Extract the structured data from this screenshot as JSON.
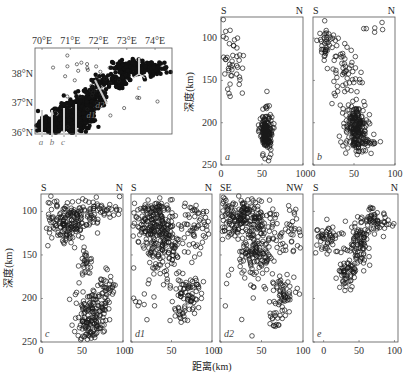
{
  "figure": {
    "y_axis_label": "深度(km)",
    "x_axis_label": "距离(km)"
  },
  "chart_data": [
    {
      "type": "scatter",
      "id": "map",
      "title": "",
      "xlabel": "",
      "ylabel": "",
      "xlim": [
        69.75,
        74.6
      ],
      "ylim": [
        35.95,
        38.9
      ],
      "x_ticks": [
        70,
        71,
        72,
        73,
        74
      ],
      "x_tick_labels": [
        "70°E",
        "71°E",
        "72°E",
        "73°E",
        "74°E"
      ],
      "y_ticks": [
        36,
        37,
        38
      ],
      "y_tick_labels": [
        "36°N",
        "37°N",
        "38°N"
      ],
      "profile_labels": [
        "a",
        "b",
        "c",
        "d1",
        "d2",
        "e"
      ],
      "description": "Epicenter map of dense seismicity band from ~70°E,36.2°N to ~74.3°E,38.4°N with profile lines a,b,c,d1,d2,e",
      "clusters": [
        {
          "cx": 70.3,
          "cy": 36.25,
          "sx": 0.25,
          "sy": 0.12,
          "n": 160,
          "fill": 1
        },
        {
          "cx": 70.9,
          "cy": 36.45,
          "sx": 0.3,
          "sy": 0.25,
          "n": 260,
          "fill": 1
        },
        {
          "cx": 71.4,
          "cy": 36.7,
          "sx": 0.25,
          "sy": 0.3,
          "n": 220,
          "fill": 1
        },
        {
          "cx": 71.8,
          "cy": 37.2,
          "sx": 0.2,
          "sy": 0.2,
          "n": 120,
          "fill": 1
        },
        {
          "cx": 72.4,
          "cy": 37.75,
          "sx": 0.3,
          "sy": 0.12,
          "n": 80,
          "fill": 1
        },
        {
          "cx": 73.0,
          "cy": 38.2,
          "sx": 0.25,
          "sy": 0.15,
          "n": 110,
          "fill": 1
        },
        {
          "cx": 73.8,
          "cy": 38.2,
          "sx": 0.35,
          "sy": 0.12,
          "n": 100,
          "fill": 1
        },
        {
          "cx": 72.0,
          "cy": 37.6,
          "sx": 0.8,
          "sy": 0.5,
          "n": 40,
          "fill": 0
        }
      ]
    },
    {
      "type": "scatter",
      "id": "a",
      "panel_label": "a",
      "left_dir": "S",
      "right_dir": "N",
      "xlim": [
        0,
        100
      ],
      "ylim": [
        250,
        75
      ],
      "x_ticks": [
        0,
        50,
        100
      ],
      "y_ticks": [
        100,
        150,
        200,
        250
      ],
      "clusters": [
        {
          "cx": 13,
          "cy": 128,
          "sx": 8,
          "sy": 17,
          "n": 45
        },
        {
          "cx": 55,
          "cy": 210,
          "sx": 3.5,
          "sy": 12,
          "n": 180
        },
        {
          "cx": 26,
          "cy": 165,
          "sx": 0,
          "sy": 0,
          "n": 1
        },
        {
          "cx": 56,
          "cy": 163,
          "sx": 0,
          "sy": 0,
          "n": 1
        }
      ]
    },
    {
      "type": "scatter",
      "id": "b",
      "panel_label": "b",
      "left_dir": "S",
      "right_dir": "N",
      "xlim": [
        0,
        100
      ],
      "ylim": [
        250,
        75
      ],
      "x_ticks": [
        0,
        50,
        100
      ],
      "y_ticks": [
        100,
        150,
        200,
        250
      ],
      "clusters": [
        {
          "cx": 16,
          "cy": 105,
          "sx": 5,
          "sy": 12,
          "n": 40
        },
        {
          "cx": 38,
          "cy": 140,
          "sx": 10,
          "sy": 15,
          "n": 55
        },
        {
          "cx": 52,
          "cy": 205,
          "sx": 6,
          "sy": 14,
          "n": 200
        },
        {
          "cx": 62,
          "cy": 225,
          "sx": 9,
          "sy": 6,
          "n": 30
        },
        {
          "cx": 75,
          "cy": 85,
          "sx": 8,
          "sy": 5,
          "n": 6
        }
      ]
    },
    {
      "type": "scatter",
      "id": "c",
      "panel_label": "c",
      "left_dir": "S",
      "right_dir": "N",
      "xlim": [
        0,
        100
      ],
      "ylim": [
        250,
        80
      ],
      "x_ticks": [
        0,
        50,
        100
      ],
      "y_ticks": [
        100,
        150,
        200,
        250
      ],
      "clusters": [
        {
          "cx": 35,
          "cy": 112,
          "sx": 14,
          "sy": 14,
          "n": 180
        },
        {
          "cx": 75,
          "cy": 100,
          "sx": 12,
          "sy": 10,
          "n": 50
        },
        {
          "cx": 55,
          "cy": 160,
          "sx": 4,
          "sy": 7,
          "n": 25
        },
        {
          "cx": 60,
          "cy": 225,
          "sx": 9,
          "sy": 18,
          "n": 170
        },
        {
          "cx": 78,
          "cy": 192,
          "sx": 5,
          "sy": 12,
          "n": 45
        }
      ]
    },
    {
      "type": "scatter",
      "id": "d1",
      "panel_label": "d1",
      "left_dir": "S",
      "right_dir": "N",
      "xlim": [
        0,
        100
      ],
      "ylim": [
        250,
        80
      ],
      "x_ticks": [
        0,
        50,
        100
      ],
      "y_ticks": [
        100,
        150,
        200,
        250
      ],
      "clusters": [
        {
          "cx": 25,
          "cy": 110,
          "sx": 15,
          "sy": 14,
          "n": 200
        },
        {
          "cx": 42,
          "cy": 145,
          "sx": 10,
          "sy": 18,
          "n": 120
        },
        {
          "cx": 85,
          "cy": 120,
          "sx": 12,
          "sy": 15,
          "n": 60
        },
        {
          "cx": 70,
          "cy": 195,
          "sx": 8,
          "sy": 12,
          "n": 70
        },
        {
          "cx": 60,
          "cy": 220,
          "sx": 4,
          "sy": 6,
          "n": 15
        },
        {
          "cx": 15,
          "cy": 180,
          "sx": 12,
          "sy": 30,
          "n": 15
        }
      ]
    },
    {
      "type": "scatter",
      "id": "d2",
      "panel_label": "d2",
      "left_dir": "SE",
      "right_dir": "NW",
      "xlim": [
        0,
        100
      ],
      "ylim": [
        250,
        80
      ],
      "x_ticks": [
        0,
        50,
        100
      ],
      "y_ticks": [
        100,
        150,
        200,
        250
      ],
      "clusters": [
        {
          "cx": 25,
          "cy": 105,
          "sx": 15,
          "sy": 13,
          "n": 200
        },
        {
          "cx": 45,
          "cy": 140,
          "sx": 12,
          "sy": 18,
          "n": 140
        },
        {
          "cx": 80,
          "cy": 125,
          "sx": 14,
          "sy": 15,
          "n": 50
        },
        {
          "cx": 75,
          "cy": 200,
          "sx": 8,
          "sy": 12,
          "n": 60
        },
        {
          "cx": 65,
          "cy": 222,
          "sx": 4,
          "sy": 5,
          "n": 15
        },
        {
          "cx": 15,
          "cy": 180,
          "sx": 10,
          "sy": 30,
          "n": 12
        }
      ]
    },
    {
      "type": "scatter",
      "id": "e",
      "panel_label": "e",
      "left_dir": "S",
      "right_dir": "N",
      "xlim": [
        -15,
        105
      ],
      "ylim": [
        250,
        80
      ],
      "x_ticks": [
        0,
        50,
        100
      ],
      "y_ticks": [
        100,
        150,
        200,
        250
      ],
      "clusters": [
        {
          "cx": 5,
          "cy": 130,
          "sx": 10,
          "sy": 9,
          "n": 55
        },
        {
          "cx": 50,
          "cy": 135,
          "sx": 8,
          "sy": 12,
          "n": 80
        },
        {
          "cx": 72,
          "cy": 110,
          "sx": 12,
          "sy": 8,
          "n": 60
        },
        {
          "cx": 35,
          "cy": 170,
          "sx": 7,
          "sy": 9,
          "n": 60
        }
      ]
    }
  ]
}
